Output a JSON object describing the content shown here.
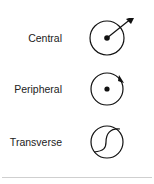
{
  "figure": {
    "items": [
      {
        "label": "Central",
        "icon": "circle-dot-outward-arrow-icon"
      },
      {
        "label": "Peripheral",
        "icon": "circle-dot-rotation-arrow-icon"
      },
      {
        "label": "Transverse",
        "icon": "circle-s-curve-icon"
      }
    ],
    "colors": {
      "stroke": "#111111",
      "text": "#222222",
      "divider": "#cfcfcf"
    }
  }
}
